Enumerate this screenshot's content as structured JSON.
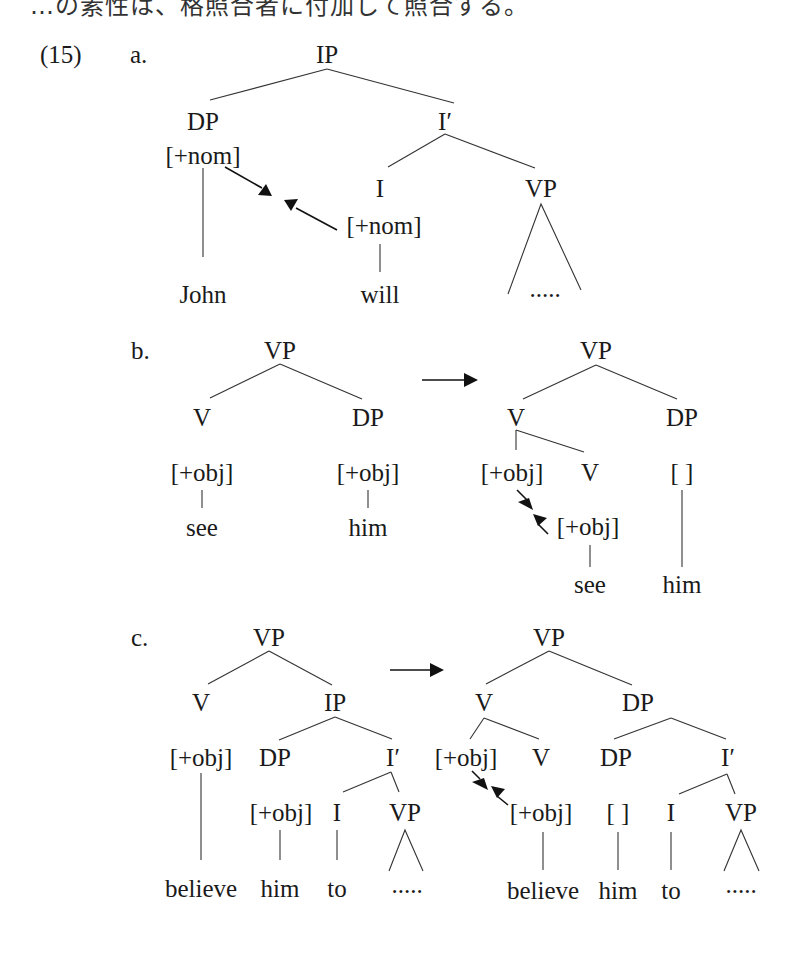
{
  "page": {
    "header_text_partial": "…の素性は、格照合者に付加して照合する。",
    "example_number": "(15)"
  },
  "trees": {
    "a": {
      "label": "a.",
      "nodes": {
        "ip": "IP",
        "dp": "DP",
        "dp_feature": "[+nom]",
        "i_bar": "I′",
        "i": "I",
        "vp": "VP",
        "i_feature": "[+nom]",
        "john": "John",
        "will": "will",
        "vp_dots": "....."
      }
    },
    "b": {
      "label": "b.",
      "before": {
        "vp": "VP",
        "v": "V",
        "dp": "DP",
        "v_feature": "[+obj]",
        "dp_feature": "[+obj]",
        "see": "see",
        "him": "him"
      },
      "after": {
        "vp": "VP",
        "v": "V",
        "dp": "DP",
        "v_feature": "[+obj]",
        "v_inner": "V",
        "dp_feature_empty": "[   ]",
        "verb_feature": "[+obj]",
        "see": "see",
        "him": "him"
      }
    },
    "c": {
      "label": "c.",
      "before": {
        "vp": "VP",
        "v": "V",
        "ip": "IP",
        "v_feature": "[+obj]",
        "dp": "DP",
        "i_bar": "I′",
        "dp_feature": "[+obj]",
        "i": "I",
        "vp_low": "VP",
        "believe": "believe",
        "him": "him",
        "to": "to",
        "dots": "....."
      },
      "after": {
        "vp": "VP",
        "v": "V",
        "dp_top": "DP",
        "v_feature": "[+obj]",
        "v_inner": "V",
        "dp": "DP",
        "i_bar": "I′",
        "verb_feature": "[+obj]",
        "dp_feature_empty": "[   ]",
        "i": "I",
        "vp_low": "VP",
        "believe": "believe",
        "him": "him",
        "to": "to",
        "dots": "....."
      }
    },
    "transformation_arrow": "→"
  }
}
